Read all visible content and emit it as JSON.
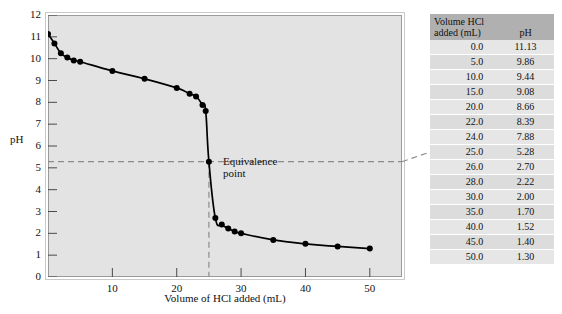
{
  "chart_data": {
    "type": "line",
    "title": "",
    "xlabel": "Volume of HCl added (mL)",
    "ylabel": "pH",
    "xlim": [
      0,
      55
    ],
    "ylim": [
      0,
      12
    ],
    "grid": false,
    "legend": null,
    "x_ticks": [
      10,
      20,
      30,
      40,
      50
    ],
    "y_ticks": [
      0,
      1,
      2,
      3,
      4,
      5,
      6,
      7,
      8,
      9,
      10,
      11,
      12
    ],
    "series": [
      {
        "name": "Titration of weak base with HCl",
        "marker": "filled-circle",
        "x": [
          0.0,
          1.0,
          2.0,
          3.0,
          4.0,
          5.0,
          10.0,
          15.0,
          20.0,
          22.0,
          23.0,
          24.0,
          24.5,
          25.0,
          26.0,
          27.0,
          28.0,
          29.0,
          30.0,
          35.0,
          40.0,
          45.0,
          50.0
        ],
        "y": [
          11.13,
          10.7,
          10.25,
          10.05,
          9.92,
          9.86,
          9.44,
          9.08,
          8.66,
          8.39,
          8.27,
          7.88,
          7.6,
          5.28,
          2.7,
          2.4,
          2.22,
          2.08,
          2.0,
          1.7,
          1.52,
          1.4,
          1.3
        ]
      }
    ],
    "annotations": [
      {
        "name": "equivalence-point",
        "label_line1": "Equivalence",
        "label_line2": "point",
        "x": 25.0,
        "y": 5.28
      }
    ]
  },
  "table": {
    "header": {
      "volume_line1": "Volume HCl",
      "volume_line2": "added (mL)",
      "ph": "pH"
    },
    "rows": [
      {
        "volume": "0.0",
        "ph": "11.13"
      },
      {
        "volume": "5.0",
        "ph": "9.86"
      },
      {
        "volume": "10.0",
        "ph": "9.44"
      },
      {
        "volume": "15.0",
        "ph": "9.08"
      },
      {
        "volume": "20.0",
        "ph": "8.66"
      },
      {
        "volume": "22.0",
        "ph": "8.39"
      },
      {
        "volume": "24.0",
        "ph": "7.88"
      },
      {
        "volume": "25.0",
        "ph": "5.28"
      },
      {
        "volume": "26.0",
        "ph": "2.70"
      },
      {
        "volume": "28.0",
        "ph": "2.22"
      },
      {
        "volume": "30.0",
        "ph": "2.00"
      },
      {
        "volume": "35.0",
        "ph": "1.70"
      },
      {
        "volume": "40.0",
        "ph": "1.52"
      },
      {
        "volume": "45.0",
        "ph": "1.40"
      },
      {
        "volume": "50.0",
        "ph": "1.30"
      }
    ],
    "highlight_row_index": 7
  },
  "colors": {
    "plot_background": "#e3e3e3",
    "curve": "#000000",
    "marker": "#000000",
    "dashed_guide": "#8c8c8c",
    "table_header": "#b0b0b0",
    "table_row_light": "#e6e6e6",
    "table_row_dark": "#dcdcdc"
  }
}
